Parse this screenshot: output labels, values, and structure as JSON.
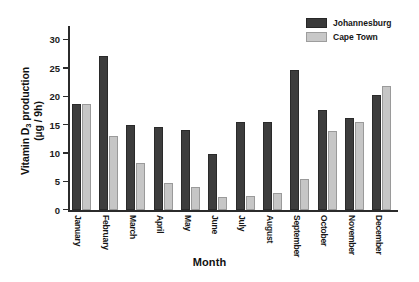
{
  "chart_data": {
    "type": "bar",
    "title": "",
    "xlabel": "Month",
    "ylabel_line1": "Vitamin D",
    "ylabel_sub": "3",
    "ylabel_line1_rest": " production",
    "ylabel_line2": "(µg / 9h)",
    "categories": [
      "January",
      "February",
      "March",
      "April",
      "May",
      "June",
      "July",
      "August",
      "September",
      "October",
      "November",
      "December"
    ],
    "series": [
      {
        "name": "Johannesburg",
        "color": "#3d3d3d",
        "values": [
          18.7,
          27.3,
          15.0,
          14.7,
          14.1,
          9.9,
          15.5,
          15.6,
          24.8,
          17.7,
          16.3,
          20.4
        ]
      },
      {
        "name": "Cape Town",
        "color": "#c6c6c6",
        "values": [
          18.8,
          13.1,
          8.3,
          4.9,
          4.1,
          2.3,
          2.6,
          3.0,
          5.6,
          14.0,
          15.6,
          21.9
        ]
      }
    ],
    "ylim": [
      0,
      32.5
    ],
    "yticks": [
      0,
      5,
      10,
      15,
      20,
      25,
      30
    ],
    "ytick_labels": [
      "0",
      "5",
      "10",
      "15",
      "20",
      "25",
      "30"
    ],
    "grid": false,
    "legend_position": "top-right"
  },
  "legend": {
    "entries": [
      {
        "label": "Johannesburg",
        "swatch": "dark"
      },
      {
        "label": "Cape Town",
        "swatch": "light"
      }
    ]
  }
}
